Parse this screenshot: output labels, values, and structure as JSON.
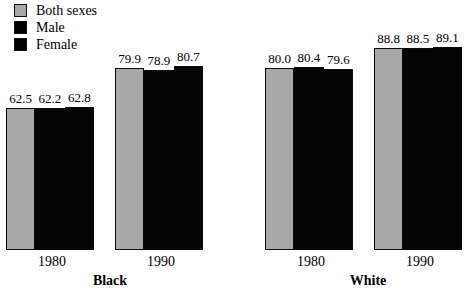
{
  "chart_data": {
    "type": "bar",
    "title": "",
    "subtitle": "",
    "xlabel": "",
    "ylabel": "",
    "grid": false,
    "legend_position": "top-left",
    "ylim": [
      0,
      100
    ],
    "categories": [
      "1980",
      "1990",
      "1980",
      "1990"
    ],
    "group_labels": [
      "Black",
      "White"
    ],
    "groups": [
      {
        "year": "1980",
        "race": "Black",
        "values": [
          62.5,
          62.2,
          62.8
        ],
        "labels": [
          "62.5",
          "62.2",
          "62.8"
        ]
      },
      {
        "year": "1990",
        "race": "Black",
        "values": [
          79.9,
          78.9,
          80.7
        ],
        "labels": [
          "79.9",
          "78.9",
          "80.7"
        ]
      },
      {
        "year": "1980",
        "race": "White",
        "values": [
          80.0,
          80.4,
          79.6
        ],
        "labels": [
          "80.0",
          "80.4",
          "79.6"
        ]
      },
      {
        "year": "1990",
        "race": "White",
        "values": [
          88.8,
          88.5,
          89.1
        ],
        "labels": [
          "88.8",
          "88.5",
          "89.1"
        ]
      }
    ],
    "series": [
      {
        "name": "Both sexes",
        "color": "#a8a8a8",
        "values": [
          62.5,
          79.9,
          80.0,
          88.8
        ]
      },
      {
        "name": "Male",
        "color": "#000000",
        "values": [
          62.2,
          78.9,
          80.4,
          88.5
        ]
      },
      {
        "name": "Female",
        "color": "#000000",
        "values": [
          62.8,
          80.7,
          79.6,
          89.1
        ]
      }
    ]
  },
  "legend": {
    "items": [
      {
        "label": "Both sexes",
        "swatch": "gray"
      },
      {
        "label": "Male",
        "swatch": "black"
      },
      {
        "label": "Female",
        "swatch": "black"
      }
    ]
  },
  "axis": {
    "year_labels": [
      "1980",
      "1990",
      "1980",
      "1990"
    ],
    "race_labels": [
      "Black",
      "White"
    ]
  },
  "colors": {
    "both_sexes": "#a8a8a8",
    "male": "#000000",
    "female": "#000000",
    "outline": "#0a0a0a",
    "background": "#ffffff"
  }
}
